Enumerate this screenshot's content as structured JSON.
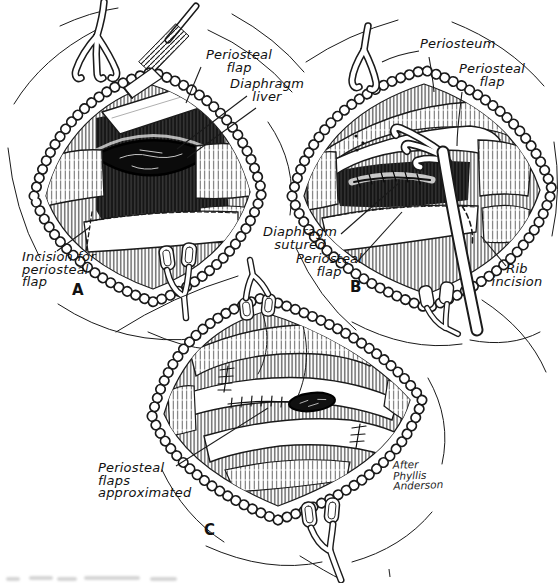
{
  "figure": {
    "ink_color": "#1a1a1a",
    "paper_color": "#ffffff",
    "style": "pen-and-ink surgical illustration, three panels"
  },
  "panels": {
    "a": {
      "letter": "A",
      "labels": {
        "periosteal_flap": {
          "l1": "Periosteal",
          "l2": "flap"
        },
        "diaphragm_liver": {
          "l1": "Diaphragm",
          "l2": "liver"
        },
        "incision": {
          "l1": "Incision for",
          "l2": "periosteal",
          "l3": "flap"
        }
      }
    },
    "b": {
      "letter": "B",
      "labels": {
        "periosteum": {
          "l1": "Periosteum"
        },
        "periosteal_flap": {
          "l1": "Periosteal",
          "l2": "flap"
        },
        "diaphragm_sutured": {
          "l1": "Diaphragm",
          "l2": "sutured"
        },
        "periosteal_flap_lower": {
          "l1": "Periosteal",
          "l2": "flap"
        },
        "rib_incision": {
          "l1": "Rib",
          "l2": "incision"
        }
      }
    },
    "c": {
      "letter": "C",
      "labels": {
        "flaps_approximated": {
          "l1": "Periosteal",
          "l2": "flaps",
          "l3": "approximated"
        }
      }
    }
  },
  "credit": {
    "l1": "After",
    "l2": "Phyllis",
    "l3": "Anderson"
  }
}
